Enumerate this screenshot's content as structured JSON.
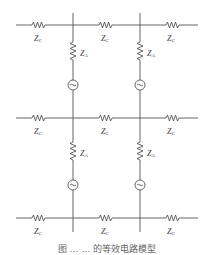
{
  "diagram": {
    "components": {
      "series_impedance": {
        "symbol": "Z",
        "subscript": "C",
        "count": 9
      },
      "shunt_impedance": {
        "symbol": "Z",
        "subscript": "A",
        "count": 4
      },
      "source": {
        "symbol": "~",
        "count": 4
      }
    },
    "labels": {
      "zc_symbol": "Z",
      "zc_sub": "C",
      "za_symbol": "Z",
      "za_sub": "A"
    },
    "colors": {
      "line": "#555555",
      "text": "#444444"
    }
  },
  "caption": {
    "text": "图 … … 的等效电路模型"
  }
}
